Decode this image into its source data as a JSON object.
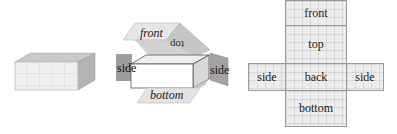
{
  "panel_1": {
    "caption": "",
    "description": "solid rectangular box with gridded faces"
  },
  "panel_2": {
    "labels": {
      "front": "front",
      "top": "top",
      "side_left": "side",
      "side_right": "side",
      "bottom": "bottom"
    }
  },
  "panel_3": {
    "net": {
      "front": "front",
      "top": "top",
      "side_left": "side",
      "back": "back",
      "side_right": "side",
      "bottom": "bottom"
    }
  },
  "colors": {
    "face_light": "#ededed",
    "face_mid": "#cfcfcf",
    "face_dark": "#a8a8a8",
    "outline": "#555555"
  }
}
